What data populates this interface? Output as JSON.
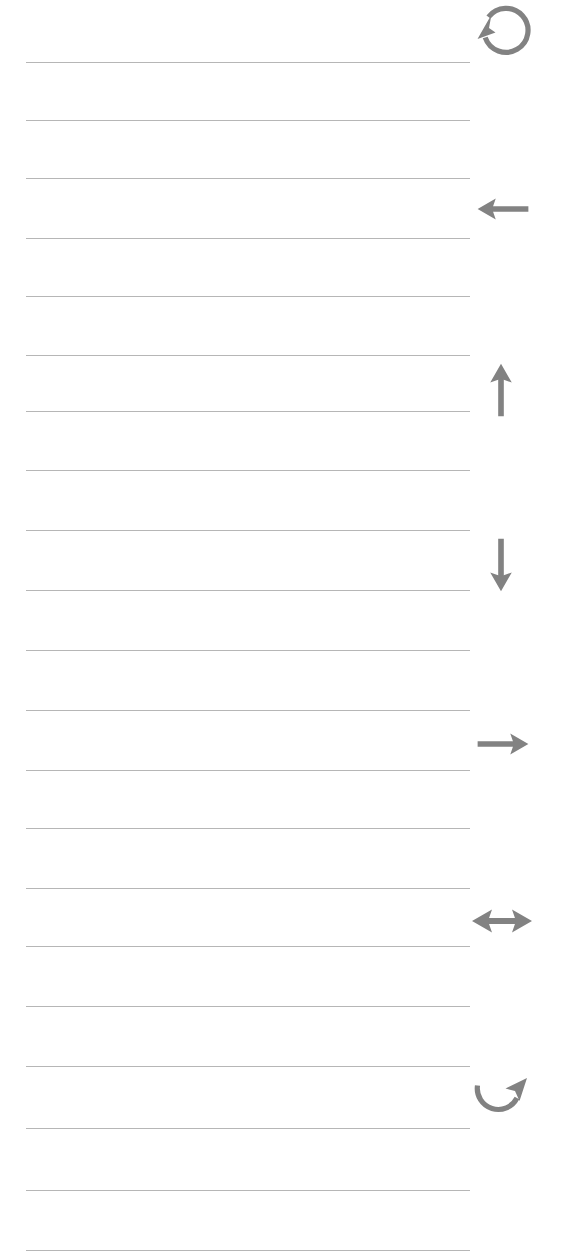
{
  "page": {
    "background_color": "#ffffff",
    "width": 572,
    "height": 1259,
    "paper_style": "ruled-lined-paper"
  },
  "rules": {
    "label": "horizontal ruled line",
    "color": "#9a9a9a",
    "thickness_px": 1.4,
    "x_start": 26,
    "x_end": 470,
    "count": 21,
    "y_positions": [
      62,
      120,
      178,
      238,
      296,
      355,
      411,
      470,
      530,
      590,
      650,
      710,
      770,
      828,
      888,
      946,
      1006,
      1066,
      1128,
      1190,
      1250
    ]
  },
  "icons": {
    "label": "margin direction glyphs",
    "color": "#828282",
    "items": [
      {
        "name": "rotate-counterclockwise-icon",
        "glyph": "↺",
        "meaning": "rotate counterclockwise / undo",
        "x": 471,
        "y": 2,
        "width": 61,
        "height": 61
      },
      {
        "name": "arrow-left-icon",
        "glyph": "←",
        "meaning": "move left",
        "x": 474,
        "y": 192,
        "width": 58,
        "height": 34
      },
      {
        "name": "arrow-up-icon",
        "glyph": "↑",
        "meaning": "move up",
        "x": 484,
        "y": 360,
        "width": 34,
        "height": 60
      },
      {
        "name": "arrow-down-icon",
        "glyph": "↓",
        "meaning": "move down",
        "x": 484,
        "y": 535,
        "width": 34,
        "height": 60
      },
      {
        "name": "arrow-right-icon",
        "glyph": "→",
        "meaning": "move right",
        "x": 474,
        "y": 727,
        "width": 58,
        "height": 34
      },
      {
        "name": "arrow-left-right-icon",
        "glyph": "↔",
        "meaning": "resize horizontally / move both directions",
        "x": 470,
        "y": 904,
        "width": 64,
        "height": 34
      },
      {
        "name": "rotate-clockwise-icon",
        "glyph": "↻",
        "meaning": "rotate clockwise / redo",
        "x": 470,
        "y": 1076,
        "width": 62,
        "height": 52
      }
    ]
  }
}
